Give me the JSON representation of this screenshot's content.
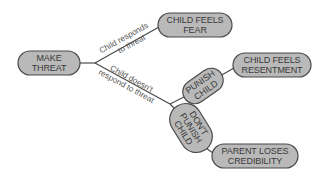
{
  "diagram": {
    "type": "decision-tree",
    "nodes": {
      "make_threat": {
        "line1": "MAKE",
        "line2": "THREAT"
      },
      "child_feels_fear": {
        "line1": "CHILD FEELS",
        "line2": "FEAR"
      },
      "punish_child": {
        "line1": "PUNISH",
        "line2": "CHILD"
      },
      "child_feels_resentment": {
        "line1": "CHILD FEELS",
        "line2": "RESENTMENT"
      },
      "dont_punish_child": {
        "line1": "DON'T",
        "line2": "PUNISH",
        "line3": "CHILD"
      },
      "parent_loses_credibility": {
        "line1": "PARENT LOSES",
        "line2": "CREDIBILITY"
      }
    },
    "edges": {
      "responds": {
        "line1": "Child responds",
        "line2": "to threat"
      },
      "doesnt_respond": {
        "line1": "Child doesn't",
        "line2": "respond to threat"
      }
    },
    "colors": {
      "node_fill": "#b9b9b9",
      "node_stroke": "#4a4a4a",
      "text": "#3a3a3a",
      "background": "#ffffff"
    }
  }
}
